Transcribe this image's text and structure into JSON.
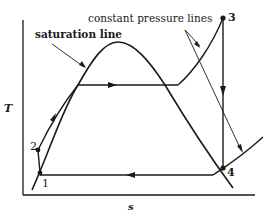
{
  "diagram": {
    "type": "T-s diagram (Rankine cycle)",
    "axes": {
      "y_label": "T",
      "x_label": "s"
    },
    "annotations": {
      "saturation_line": "saturation line",
      "constant_pressure_lines": "constant pressure lines"
    },
    "points": [
      {
        "id": "1",
        "label": "1"
      },
      {
        "id": "2",
        "label": "2"
      },
      {
        "id": "3",
        "label": "3"
      },
      {
        "id": "4",
        "label": "4"
      }
    ],
    "colors": {
      "line": "#1a1a1a",
      "background": "#ffffff"
    }
  }
}
